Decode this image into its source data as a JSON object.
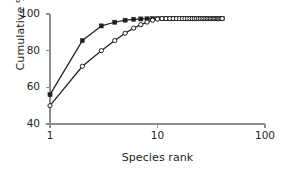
{
  "chart_data": {
    "type": "line",
    "title": "",
    "subtitle": "",
    "xlabel": "Species rank",
    "ylabel": "Cumulative %",
    "xscale": "log",
    "yscale": "linear",
    "xlim": [
      1,
      100
    ],
    "ylim": [
      40,
      100
    ],
    "xticks": [
      1,
      10,
      100
    ],
    "xtick_labels": [
      "1",
      "10",
      "100"
    ],
    "yticks": [
      40,
      60,
      80,
      100
    ],
    "ytick_labels": [
      "40",
      "60",
      "80",
      "100"
    ],
    "grid": false,
    "legend": "none",
    "series": [
      {
        "name": "filled-squares",
        "marker": "filled-square",
        "color": "#231f20",
        "x": [
          1,
          2,
          3,
          4,
          5,
          6,
          7,
          8,
          9,
          10,
          11,
          12,
          13,
          14,
          15,
          16,
          17,
          18,
          19,
          20,
          21,
          22,
          23,
          24,
          25,
          26,
          27,
          28,
          29,
          30,
          31,
          32,
          33,
          34,
          35,
          36,
          37,
          38,
          39,
          40
        ],
        "y": [
          56.0,
          85.5,
          93.5,
          95.5,
          96.6,
          97.1,
          97.3,
          97.4,
          97.5,
          97.5,
          97.5,
          97.5,
          97.5,
          97.5,
          97.5,
          97.5,
          97.5,
          97.5,
          97.5,
          97.5,
          97.5,
          97.5,
          97.5,
          97.5,
          97.5,
          97.5,
          97.5,
          97.5,
          97.5,
          97.5,
          97.5,
          97.5,
          97.5,
          97.5,
          97.5,
          97.5,
          97.5,
          97.5,
          97.5,
          97.5
        ]
      },
      {
        "name": "open-circles",
        "marker": "open-circle",
        "color": "#231f20",
        "x": [
          1,
          2,
          3,
          4,
          5,
          6,
          7,
          8,
          9,
          10,
          11,
          12,
          13,
          14,
          15,
          16,
          17,
          18,
          19,
          20,
          21,
          22,
          23,
          24,
          25,
          26,
          27,
          28,
          29,
          30,
          31,
          32,
          33,
          34,
          35,
          36,
          37,
          38,
          39,
          40
        ],
        "y": [
          50.0,
          71.5,
          80.0,
          85.5,
          89.5,
          92.3,
          94.2,
          95.6,
          96.6,
          97.2,
          97.5,
          97.5,
          97.5,
          97.5,
          97.5,
          97.5,
          97.5,
          97.5,
          97.5,
          97.5,
          97.5,
          97.5,
          97.5,
          97.5,
          97.5,
          97.5,
          97.5,
          97.5,
          97.5,
          97.5,
          97.5,
          97.5,
          97.5,
          97.5,
          97.5,
          97.5,
          97.5,
          97.5,
          97.5,
          97.5
        ]
      }
    ]
  },
  "axes": {
    "x_label": "Species rank",
    "y_label": "Cumulative %"
  }
}
